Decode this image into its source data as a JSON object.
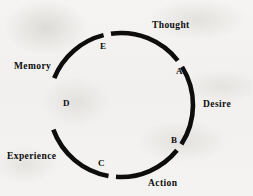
{
  "diagram": {
    "type": "circular-cycle",
    "stroke_color": "#0d0d0d",
    "background_color": "#f3f2f0",
    "circle": {
      "cx": 121,
      "cy": 105,
      "r": 72,
      "stroke_width": 4.6
    },
    "segments": [
      {
        "id": "thought",
        "label": "Thought",
        "start_deg": -68,
        "end_deg": -14
      },
      {
        "id": "desire",
        "label": "Desire",
        "start_deg": -8,
        "end_deg": 52
      },
      {
        "id": "action",
        "label": "Action",
        "start_deg": 58,
        "end_deg": 123
      },
      {
        "id": "experience",
        "label": "Experience",
        "start_deg": 129,
        "end_deg": 184
      },
      {
        "id": "memory",
        "label": "Memory",
        "start_deg": 190,
        "end_deg": 250
      }
    ],
    "nodes": [
      {
        "id": "a",
        "label": "A",
        "between": "thought-desire"
      },
      {
        "id": "b",
        "label": "B",
        "between": "desire-action"
      },
      {
        "id": "c",
        "label": "C",
        "between": "action-experience"
      },
      {
        "id": "d",
        "label": "D",
        "between": "experience-memory"
      },
      {
        "id": "e",
        "label": "E",
        "between": "memory-thought"
      }
    ]
  }
}
